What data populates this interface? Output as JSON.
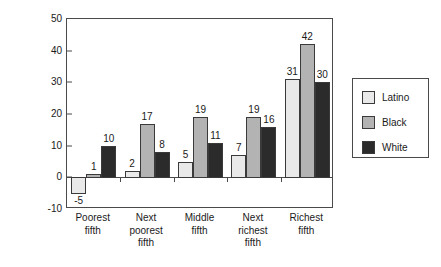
{
  "chart_data": {
    "type": "bar",
    "title": "",
    "xlabel": "",
    "ylabel": "Percent",
    "ylim": [
      -10,
      50
    ],
    "yticks": [
      -10,
      0,
      10,
      20,
      30,
      40,
      50
    ],
    "ytick_labels": [
      "-10",
      "0",
      "10",
      "20",
      "30",
      "40",
      "50"
    ],
    "grid": false,
    "legend_position": "right",
    "categories": [
      "Poorest\nfifth",
      "Next\npoorest\nfifth",
      "Middle\nfifth",
      "Next\nrichest\nfifth",
      "Richest\nfifth"
    ],
    "series": [
      {
        "name": "Latino",
        "color": "#e9e9e9",
        "values": [
          -5,
          2,
          5,
          7,
          31
        ]
      },
      {
        "name": "Black",
        "color": "#b3b3b3",
        "values": [
          1,
          17,
          19,
          19,
          42
        ]
      },
      {
        "name": "White",
        "color": "#2b2b2b",
        "values": [
          10,
          8,
          11,
          16,
          30
        ]
      }
    ],
    "value_labels": [
      [
        "-5",
        "1",
        "10"
      ],
      [
        "2",
        "17",
        "8"
      ],
      [
        "5",
        "19",
        "11"
      ],
      [
        "7",
        "19",
        "16"
      ],
      [
        "31",
        "42",
        "30"
      ]
    ]
  },
  "legend": {
    "items": [
      {
        "label": "Latino",
        "color": "#e9e9e9"
      },
      {
        "label": "Black",
        "color": "#b3b3b3"
      },
      {
        "label": "White",
        "color": "#2b2b2b"
      }
    ]
  },
  "axis": {
    "y_title": "Percent"
  }
}
